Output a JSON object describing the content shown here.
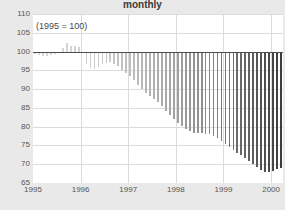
{
  "chart_data": {
    "type": "bar",
    "title": "monthly",
    "subtitle": "",
    "annotation": "(1995 = 100)",
    "xlabel": "",
    "ylabel": "",
    "baseline": 100,
    "ylim": [
      65,
      110
    ],
    "yticks": [
      110,
      105,
      100,
      95,
      90,
      85,
      80,
      75,
      70,
      65
    ],
    "ytick_labels": [
      "110",
      "105",
      "100",
      "95",
      "90",
      "85",
      "80",
      "75",
      "70",
      "65"
    ],
    "xlim": [
      1995.0,
      2000.25
    ],
    "xticks": [
      1995,
      1996,
      1997,
      1998,
      1999,
      2000
    ],
    "xtick_labels": [
      "1995",
      "1996",
      "1997",
      "1998",
      "1999",
      "2000"
    ],
    "grid": true,
    "legend": "none",
    "bar_color_start": "#d8d8d8",
    "bar_color_end": "#3c3c3c",
    "baseline_color": "#4d4d4d",
    "plot_bg": "#ffffff",
    "figure_bg": "#e9e9e9",
    "grid_color": "#dcdcdc",
    "x": [
      1995.0,
      1995.083,
      1995.167,
      1995.25,
      1995.333,
      1995.417,
      1995.5,
      1995.583,
      1995.667,
      1995.75,
      1995.833,
      1995.917,
      1996.0,
      1996.083,
      1996.167,
      1996.25,
      1996.333,
      1996.417,
      1996.5,
      1996.583,
      1996.667,
      1996.75,
      1996.833,
      1996.917,
      1997.0,
      1997.083,
      1997.167,
      1997.25,
      1997.333,
      1997.417,
      1997.5,
      1997.583,
      1997.667,
      1997.75,
      1997.833,
      1997.917,
      1998.0,
      1998.083,
      1998.167,
      1998.25,
      1998.333,
      1998.417,
      1998.5,
      1998.583,
      1998.667,
      1998.75,
      1998.833,
      1998.917,
      1999.0,
      1999.083,
      1999.167,
      1999.25,
      1999.333,
      1999.417,
      1999.5,
      1999.583,
      1999.667,
      1999.75,
      1999.833,
      1999.917,
      2000.0,
      2000.083,
      2000.167
    ],
    "values": [
      99.3,
      99.0,
      98.8,
      98.9,
      99.2,
      99.4,
      99.6,
      101.0,
      102.3,
      101.4,
      101.6,
      101.2,
      99.6,
      96.8,
      95.6,
      95.4,
      96.0,
      96.6,
      97.0,
      97.3,
      96.8,
      96.1,
      95.2,
      94.3,
      93.4,
      92.3,
      91.2,
      90.1,
      89.0,
      88.2,
      87.4,
      86.5,
      85.4,
      84.3,
      83.2,
      82.1,
      81.0,
      80.1,
      79.4,
      78.8,
      78.4,
      78.3,
      78.2,
      78.1,
      78.0,
      77.6,
      77.0,
      76.2,
      75.4,
      74.6,
      73.8,
      73.1,
      72.4,
      71.6,
      70.8,
      70.1,
      69.3,
      68.5,
      68.0,
      67.8,
      68.1,
      68.6,
      68.9
    ]
  }
}
